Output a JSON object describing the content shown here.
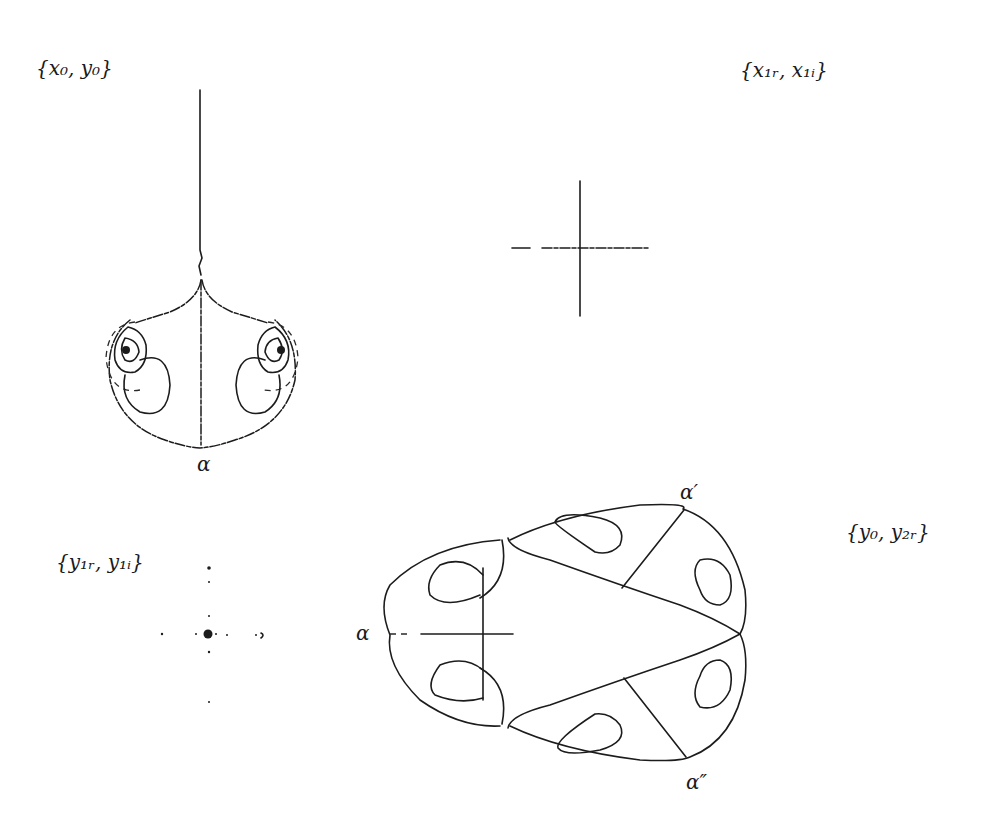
{
  "figure": {
    "panels": [
      {
        "id": "top-left",
        "label": "{x₀, y₀}",
        "description": "Phase portrait with vertical separatrix, two spiral foci and a closed outer boundary",
        "annotations": [
          "α"
        ]
      },
      {
        "id": "top-right",
        "label": "{x₁ᵣ, x₁ᵢ}",
        "description": "Cross of two short line segments (degenerate projection)",
        "annotations": []
      },
      {
        "id": "bottom-left",
        "label": "{y₁ᵣ, y₁ᵢ}",
        "description": "Central dot with sparse scattered points along two axes",
        "annotations": []
      },
      {
        "id": "bottom-right",
        "label": "{y₀, y₂ᵣ}",
        "description": "Egg-shaped closed orbit with six inner loops and three transversal segments",
        "annotations": [
          "α",
          "α′",
          "α″"
        ]
      }
    ]
  },
  "colors": {
    "ink": "#1c1c1c",
    "background": "#ffffff"
  }
}
